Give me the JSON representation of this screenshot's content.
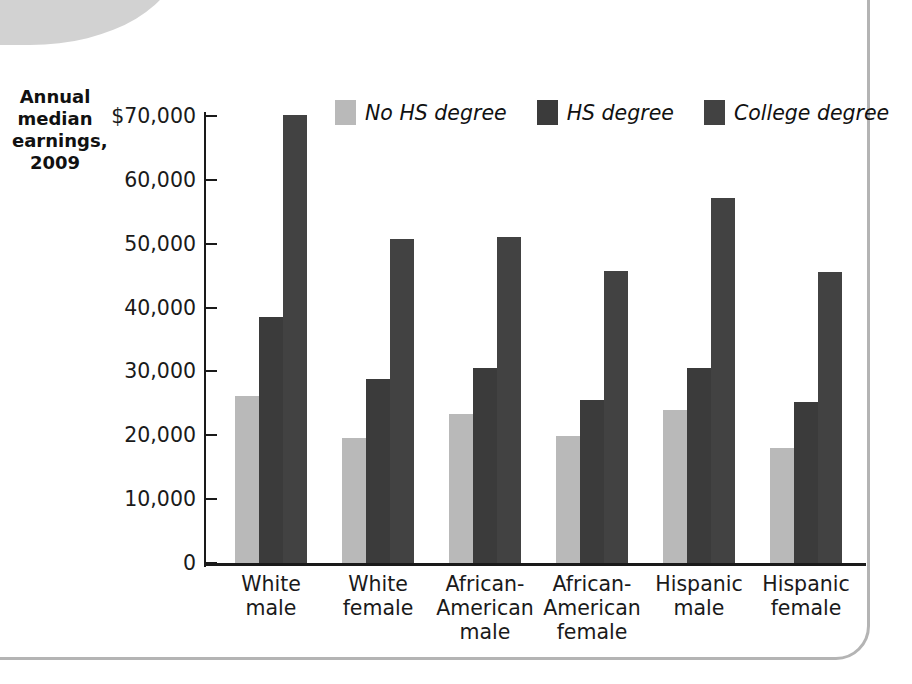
{
  "figure": {
    "y_axis_title_lines": [
      "Annual",
      "median",
      "earnings,",
      "2009"
    ],
    "frame_color": "#b4b4b4",
    "tab_color": "#d2d2d2"
  },
  "legend": {
    "items": [
      {
        "label": "No HS degree",
        "color": "#b9b9b9",
        "swatch_name": "legend-swatch-no-hs-degree"
      },
      {
        "label": "HS degree",
        "color": "#3b3b3b",
        "swatch_name": "legend-swatch-hs-degree"
      },
      {
        "label": "College degree",
        "color": "#424242",
        "swatch_name": "legend-swatch-college-degree"
      }
    ]
  },
  "axis": {
    "y_ticks": [
      "$70,000",
      "60,000",
      "50,000",
      "40,000",
      "30,000",
      "20,000",
      "10,000",
      "0"
    ],
    "y_tick_values": [
      70000,
      60000,
      50000,
      40000,
      30000,
      20000,
      10000,
      0
    ]
  },
  "categories": [
    {
      "lines": [
        "White",
        "male"
      ]
    },
    {
      "lines": [
        "White",
        "female"
      ]
    },
    {
      "lines": [
        "African-",
        "American",
        "male"
      ]
    },
    {
      "lines": [
        "African-",
        "American",
        "female"
      ]
    },
    {
      "lines": [
        "Hispanic",
        "male"
      ]
    },
    {
      "lines": [
        "Hispanic",
        "female"
      ]
    }
  ],
  "chart_data": {
    "type": "bar",
    "title": "",
    "subtitle": "",
    "xlabel": "",
    "ylabel": "Annual median earnings, 2009",
    "ylim": [
      0,
      70000
    ],
    "ytick_step": 10000,
    "grid": false,
    "legend_position": "top-center",
    "categories": [
      "White male",
      "White female",
      "African-American male",
      "African-American female",
      "Hispanic male",
      "Hispanic female"
    ],
    "series": [
      {
        "name": "No HS degree",
        "color": "#b9b9b9",
        "values": [
          26200,
          19500,
          23300,
          19900,
          23900,
          18000
        ]
      },
      {
        "name": "HS degree",
        "color": "#3b3b3b",
        "values": [
          38500,
          28800,
          30500,
          25600,
          30600,
          25200
        ]
      },
      {
        "name": "College degree",
        "color": "#424242",
        "values": [
          70200,
          50700,
          51100,
          45800,
          57200,
          45500
        ]
      }
    ]
  }
}
